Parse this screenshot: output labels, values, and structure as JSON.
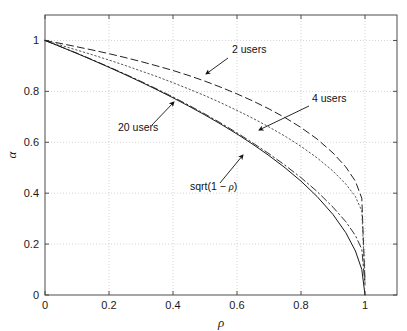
{
  "chart_data": {
    "type": "line",
    "title": "",
    "xlabel": "ρ",
    "ylabel": "α",
    "xlim": [
      0,
      1.1
    ],
    "ylim": [
      0,
      1.1
    ],
    "xticks": [
      "0",
      "0.2",
      "0.4",
      "0.6",
      "0.8",
      "1"
    ],
    "xtick_values": [
      0,
      0.2,
      0.4,
      0.6,
      0.8,
      1
    ],
    "yticks": [
      "0",
      "0.2",
      "0.4",
      "0.6",
      "0.8",
      "1"
    ],
    "ytick_values": [
      0,
      0.2,
      0.4,
      0.6,
      0.8,
      1
    ],
    "grid": true,
    "grid_style": "dotted",
    "grid_color": "#c8c8c8",
    "axis_color": "#4d4d4d",
    "legend": "none",
    "legend_position": "annotations-inline",
    "x": [
      0,
      0.05,
      0.1,
      0.15,
      0.2,
      0.25,
      0.3,
      0.35,
      0.4,
      0.45,
      0.5,
      0.55,
      0.6,
      0.65,
      0.7,
      0.75,
      0.8,
      0.85,
      0.9,
      0.94,
      0.97,
      0.99,
      1
    ],
    "series": [
      {
        "name": "2 users",
        "style": "dashed",
        "color": "#222222",
        "values": [
          1,
          0.988,
          0.975,
          0.962,
          0.948,
          0.933,
          0.917,
          0.9,
          0.882,
          0.862,
          0.84,
          0.816,
          0.79,
          0.762,
          0.731,
          0.697,
          0.658,
          0.613,
          0.558,
          0.503,
          0.447,
          0.38,
          0.05
        ]
      },
      {
        "name": "4 users",
        "style": "dotted",
        "color": "#555555",
        "values": [
          1,
          0.981,
          0.962,
          0.943,
          0.923,
          0.902,
          0.88,
          0.858,
          0.834,
          0.809,
          0.783,
          0.755,
          0.725,
          0.694,
          0.66,
          0.624,
          0.584,
          0.539,
          0.487,
          0.436,
          0.387,
          0.33,
          0.05
        ]
      },
      {
        "name": "20 users",
        "style": "dashdot",
        "color": "#333333",
        "values": [
          1,
          0.975,
          0.95,
          0.923,
          0.896,
          0.868,
          0.839,
          0.809,
          0.778,
          0.745,
          0.711,
          0.675,
          0.637,
          0.597,
          0.555,
          0.51,
          0.461,
          0.407,
          0.345,
          0.288,
          0.234,
          0.18,
          0.04
        ]
      },
      {
        "name": "sqrt(1 − ρ)",
        "style": "solid",
        "color": "#1a1a1a",
        "values": [
          1,
          0.9747,
          0.9487,
          0.922,
          0.8944,
          0.866,
          0.8367,
          0.8062,
          0.7746,
          0.7416,
          0.7071,
          0.6708,
          0.6325,
          0.5916,
          0.5477,
          0.5,
          0.4472,
          0.3873,
          0.3162,
          0.2449,
          0.1732,
          0.1,
          0.0
        ]
      }
    ],
    "annotations": [
      {
        "name": "2 users",
        "label": "2 users",
        "text_x": 232,
        "text_y": 53,
        "arrow_from_x": 228,
        "arrow_from_y": 58,
        "arrow_to_x": 206,
        "arrow_to_y": 74
      },
      {
        "name": "4 users",
        "label": "4 users",
        "text_x": 312,
        "text_y": 102,
        "arrow_from_x": 309,
        "arrow_from_y": 106,
        "arrow_to_x": 259,
        "arrow_to_y": 130
      },
      {
        "name": "20 users",
        "label": "20 users",
        "text_x": 118,
        "text_y": 131,
        "arrow_from_x": 152,
        "arrow_from_y": 125,
        "arrow_to_x": 174,
        "arrow_to_y": 102
      },
      {
        "name": "sqrt-label",
        "label": "sqrt(1 − ρ)",
        "text_x": 190,
        "text_y": 190,
        "arrow_from_x": 220,
        "arrow_from_y": 183,
        "arrow_to_x": 243,
        "arrow_to_y": 155
      }
    ]
  },
  "axes": {
    "xlabel": "ρ",
    "ylabel": "α",
    "xtick_labels": [
      "0",
      "0.2",
      "0.4",
      "0.6",
      "0.8",
      "1"
    ],
    "ytick_labels": [
      "0",
      "0.2",
      "0.4",
      "0.6",
      "0.8",
      "1"
    ]
  },
  "annotation_labels": {
    "two_users": "2 users",
    "four_users": "4 users",
    "twenty_users": "20 users",
    "sqrt_curve": "sqrt(1 − ρ)"
  }
}
